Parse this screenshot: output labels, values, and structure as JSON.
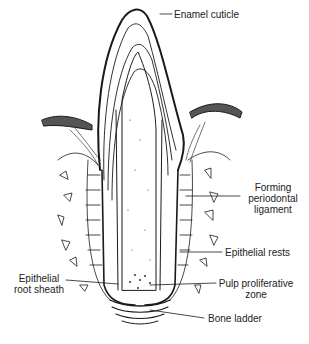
{
  "diagram": {
    "labels": {
      "enamel_cuticle": "Enamel cuticle",
      "forming_pdl_1": "Forming",
      "forming_pdl_2": "periodontal",
      "forming_pdl_3": "ligament",
      "epithelial_rests": "Epithelial rests",
      "epithelial_root_sheath_1": "Epithelial",
      "epithelial_root_sheath_2": "root sheath",
      "pulp_proliferative_1": "Pulp proliferative",
      "pulp_proliferative_2": "zone",
      "bone_ladder": "Bone ladder"
    },
    "colors": {
      "line": "#1a1a1a",
      "background": "#ffffff"
    }
  }
}
